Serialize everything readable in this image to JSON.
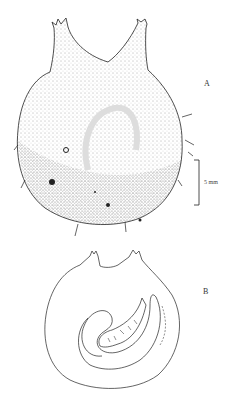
{
  "figure": {
    "panels": [
      {
        "id": "A",
        "label": "A",
        "description": "stippled external view of specimen with two siphons"
      },
      {
        "id": "B",
        "label": "B",
        "description": "outline view showing coiled gut loop"
      }
    ],
    "scale_bar": {
      "label": "5 mm"
    }
  },
  "colors": {
    "ink": "#222222",
    "background": "#ffffff"
  }
}
